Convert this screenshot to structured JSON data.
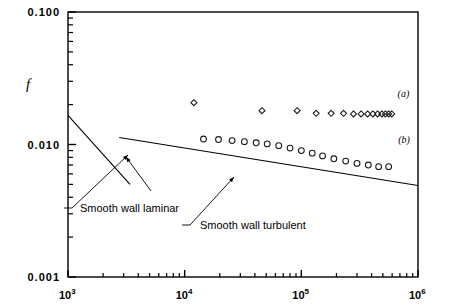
{
  "chart_data": {
    "type": "scatter",
    "title": "",
    "xlabel": "",
    "ylabel": "f",
    "xscale": "log",
    "yscale": "log",
    "xlim": [
      1000,
      1000000
    ],
    "ylim": [
      0.001,
      0.1
    ],
    "grid": false,
    "legend_position": "inline-right",
    "x_tick_labels": [
      "10",
      "10",
      "10",
      "10"
    ],
    "x_tick_exponents": [
      "3",
      "4",
      "5",
      "6"
    ],
    "x_tick_values": [
      1000,
      10000,
      100000,
      1000000
    ],
    "y_tick_labels": [
      "0.100",
      "0.010",
      "0.001"
    ],
    "y_tick_values": [
      0.1,
      0.01,
      0.001
    ],
    "series": [
      {
        "name": "(a)",
        "marker": "diamond",
        "label_x": 750000,
        "label_y": 0.0228,
        "points": [
          [
            12000,
            0.0207
          ],
          [
            46000,
            0.018
          ],
          [
            92000,
            0.018
          ],
          [
            134000,
            0.0172
          ],
          [
            180000,
            0.0172
          ],
          [
            230000,
            0.0172
          ],
          [
            280000,
            0.017
          ],
          [
            325000,
            0.017
          ],
          [
            370000,
            0.017
          ],
          [
            410000,
            0.017
          ],
          [
            450000,
            0.017
          ],
          [
            490000,
            0.017
          ],
          [
            525000,
            0.017
          ],
          [
            560000,
            0.017
          ],
          [
            595000,
            0.017
          ]
        ]
      },
      {
        "name": "(b)",
        "marker": "circle",
        "label_x": 760000,
        "label_y": 0.0103,
        "points": [
          [
            14500,
            0.011
          ],
          [
            19500,
            0.0109
          ],
          [
            25500,
            0.0107
          ],
          [
            32500,
            0.0105
          ],
          [
            41000,
            0.0103
          ],
          [
            51000,
            0.0101
          ],
          [
            64000,
            0.0098
          ],
          [
            80000,
            0.0094
          ],
          [
            100000,
            0.009
          ],
          [
            124000,
            0.0086
          ],
          [
            152000,
            0.0082
          ],
          [
            190000,
            0.0078
          ],
          [
            240000,
            0.0075
          ],
          [
            300000,
            0.0072
          ],
          [
            375000,
            0.007
          ],
          [
            460000,
            0.0068
          ],
          [
            560000,
            0.0068
          ]
        ]
      }
    ],
    "reference_lines": [
      {
        "name": "Smooth wall laminar",
        "label": "Smooth wall laminar",
        "points": [
          [
            1000,
            0.0166
          ],
          [
            3400,
            0.005
          ]
        ]
      },
      {
        "name": "Smooth wall turbulent",
        "label": "Smooth wall turbulent",
        "points": [
          [
            2750,
            0.0113
          ],
          [
            1000000,
            0.0049
          ]
        ]
      }
    ],
    "annotations": [
      {
        "text": "Smooth wall laminar",
        "text_x": 68,
        "text_y": 212,
        "leaders": [
          [
            [
              64,
              208
            ],
            [
              72,
              208
            ]
          ],
          [
            [
              72,
              208
            ],
            [
              128,
              155
            ]
          ],
          [
            [
              151,
              191
            ],
            [
              126,
              157
            ]
          ]
        ]
      },
      {
        "text": "Smooth wall turbulent",
        "text_x": 188,
        "text_y": 229,
        "leaders": [
          [
            [
              182,
              225
            ],
            [
              190,
              225
            ]
          ],
          [
            [
              190,
              225
            ],
            [
              234,
              177
            ]
          ]
        ]
      }
    ]
  },
  "axes": {
    "y_axis_label": "f",
    "y_labels": [
      "0.100",
      "0.010",
      "0.001"
    ],
    "x_labels": [
      {
        "mantissa": "10",
        "exponent": "3"
      },
      {
        "mantissa": "10",
        "exponent": "4"
      },
      {
        "mantissa": "10",
        "exponent": "5"
      },
      {
        "mantissa": "10",
        "exponent": "6"
      }
    ]
  },
  "annotation_labels": {
    "laminar": "Smooth wall laminar",
    "turbulent": "Smooth wall turbulent"
  },
  "series_labels": {
    "a": "(a)",
    "b": "(b)"
  },
  "colors": {
    "axis": "#000000",
    "marker": "#1a1a1a",
    "background": "#ffffff"
  }
}
